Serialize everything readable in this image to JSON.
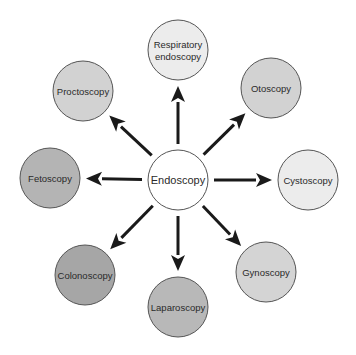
{
  "diagram": {
    "center": {
      "label": "Endoscopy",
      "fill": "#ffffff"
    },
    "nodes": [
      {
        "id": "respiratory",
        "lines": [
          "Respiratory",
          "endoscopy"
        ],
        "fill": "#ececec"
      },
      {
        "id": "otoscopy",
        "lines": [
          "Otoscopy"
        ],
        "fill": "#d2d2d2"
      },
      {
        "id": "cystoscopy",
        "lines": [
          "Cystoscopy"
        ],
        "fill": "#ececec"
      },
      {
        "id": "gynoscopy",
        "lines": [
          "Gynoscopy"
        ],
        "fill": "#d4d4d4"
      },
      {
        "id": "laparoscopy",
        "lines": [
          "Laparoscopy"
        ],
        "fill": "#b8b8b8"
      },
      {
        "id": "colonoscopy",
        "lines": [
          "Colonoscopy"
        ],
        "fill": "#a6a6a6"
      },
      {
        "id": "fetoscopy",
        "lines": [
          "Fetoscopy"
        ],
        "fill": "#b4b4b4"
      },
      {
        "id": "proctoscopy",
        "lines": [
          "Proctoscopy"
        ],
        "fill": "#d2d2d2"
      }
    ],
    "arrow_color": "#1a1a1a",
    "outline_color": "#555555"
  }
}
